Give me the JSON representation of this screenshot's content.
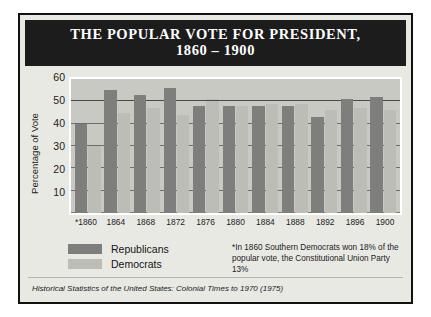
{
  "figure": {
    "title_line1": "THE POPULAR VOTE FOR PRESIDENT,",
    "title_line2": "1860 – 1900",
    "source": "Historical Statistics of the United States: Colonial Times to 1970 (1975)",
    "footnote": "*In 1860 Southern Democrats won 18% of the popular vote, the Constitutional Union Party 13%",
    "colors": {
      "republican": "#7e7e7c",
      "democrat": "#bdbdb8",
      "banner": "#1c1c1c",
      "panel": "#e9e9e4",
      "plot": "#c9c9c4"
    }
  },
  "legend": {
    "position": "below-axis-left",
    "items": [
      {
        "label": "Republicans",
        "key": "republican"
      },
      {
        "label": "Democrats",
        "key": "democrat"
      }
    ]
  },
  "chart_data": {
    "type": "bar",
    "title": "THE POPULAR VOTE FOR PRESIDENT, 1860 – 1900",
    "xlabel": "",
    "ylabel": "Percentage of Vote",
    "ylim": [
      0,
      60
    ],
    "yticks": [
      60,
      50,
      40,
      30,
      20,
      10
    ],
    "grid": true,
    "reference_line": 50,
    "categories": [
      "*1860",
      "1864",
      "1868",
      "1872",
      "1876",
      "1880",
      "1884",
      "1888",
      "1892",
      "1896",
      "1900"
    ],
    "series": [
      {
        "name": "Republicans",
        "color": "#7e7e7c",
        "values": [
          40,
          55,
          53,
          56,
          48,
          48,
          48,
          48,
          43,
          51,
          52
        ]
      },
      {
        "name": "Democrats",
        "color": "#bdbdb8",
        "values": [
          30,
          45,
          47,
          44,
          51,
          48,
          49,
          49,
          46,
          47,
          46
        ]
      }
    ]
  }
}
